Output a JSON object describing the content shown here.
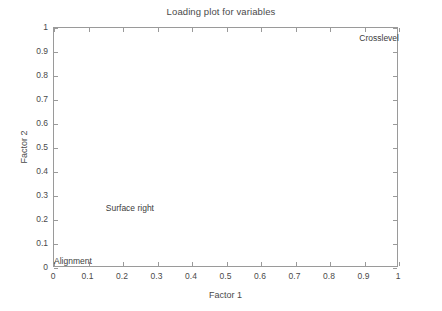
{
  "chart_data": {
    "type": "scatter",
    "title": "Loading plot for variables",
    "xlabel": "Factor 1",
    "ylabel": "Factor 2",
    "xlim": [
      0,
      1
    ],
    "ylim": [
      0,
      1
    ],
    "grid": false,
    "legend": "none",
    "xticks": [
      "0",
      "0.1",
      "0.2",
      "0.3",
      "0.4",
      "0.5",
      "0.6",
      "0.7",
      "0.8",
      "0.9",
      "1"
    ],
    "xtick_values": [
      0,
      0.1,
      0.2,
      0.3,
      0.4,
      0.5,
      0.6,
      0.7,
      0.8,
      0.9,
      1
    ],
    "yticks": [
      "0",
      "0.1",
      "0.2",
      "0.3",
      "0.4",
      "0.5",
      "0.6",
      "0.7",
      "0.8",
      "0.9",
      "1"
    ],
    "ytick_values": [
      0,
      0.1,
      0.2,
      0.3,
      0.4,
      0.5,
      0.6,
      0.7,
      0.8,
      0.9,
      1
    ],
    "points": [
      {
        "label": "Crosslevel",
        "x": 1.0,
        "y": 0.96,
        "anchor": "right"
      },
      {
        "label": "Surface right",
        "x": 0.22,
        "y": 0.25,
        "anchor": "center"
      },
      {
        "label": "Alignment",
        "x": 0.0,
        "y": 0.03,
        "anchor": "left"
      }
    ],
    "colors": {
      "background": "#ffffff",
      "frame": "#9a9a9a",
      "text": "#4a4a4a",
      "label_text": "#3c3c3c"
    }
  }
}
